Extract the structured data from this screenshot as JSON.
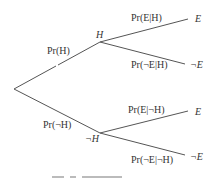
{
  "diagram": {
    "type": "probability-tree",
    "root": {
      "label": ""
    },
    "level1": [
      {
        "node": "H",
        "edge_label": "Pr(H)"
      },
      {
        "node": "¬H",
        "edge_label": "Pr(¬H)"
      }
    ],
    "level2": [
      {
        "parent": "H",
        "node": "E",
        "edge_label": "Pr(E|H)"
      },
      {
        "parent": "H",
        "node": "¬E",
        "edge_label": "Pr(¬E|H)"
      },
      {
        "parent": "¬H",
        "node": "E",
        "edge_label": "Pr(E|¬H)"
      },
      {
        "parent": "¬H",
        "node": "¬E",
        "edge_label": "Pr(¬E|¬H)"
      }
    ]
  },
  "colors": {
    "line": "#555555",
    "text": "#333333",
    "background": "#ffffff"
  }
}
